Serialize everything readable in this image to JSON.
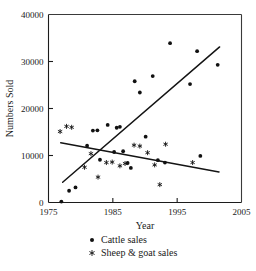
{
  "chart_data": {
    "type": "scatter",
    "title": "",
    "xlabel": "Year",
    "ylabel": "Numbers Sold",
    "xlim": [
      1975,
      2005
    ],
    "ylim": [
      0,
      40000
    ],
    "xticks": [
      1975,
      1985,
      1995,
      2005
    ],
    "yticks": [
      0,
      10000,
      20000,
      30000,
      40000
    ],
    "xtick_labels": [
      "1975",
      "1985",
      "1995",
      "2005"
    ],
    "ytick_labels": [
      "0",
      "10000",
      "20000",
      "30000",
      "40000"
    ],
    "grid": false,
    "legend_position": "below-axes",
    "series": [
      {
        "name": "Cattle sales",
        "marker": "filled-circle",
        "color": "#111111",
        "points": [
          [
            1977.0,
            200
          ],
          [
            1978.2,
            2500
          ],
          [
            1979.2,
            3200
          ],
          [
            1981.0,
            12100
          ],
          [
            1981.9,
            15300
          ],
          [
            1982.6,
            15350
          ],
          [
            1983.0,
            9100
          ],
          [
            1984.2,
            16500
          ],
          [
            1985.2,
            10750
          ],
          [
            1985.6,
            15900
          ],
          [
            1986.1,
            16100
          ],
          [
            1986.6,
            10900
          ],
          [
            1987.3,
            8400
          ],
          [
            1987.8,
            7350
          ],
          [
            1988.4,
            25800
          ],
          [
            1989.2,
            23400
          ],
          [
            1990.1,
            14000
          ],
          [
            1991.2,
            26900
          ],
          [
            1992.0,
            9000
          ],
          [
            1993.1,
            8500
          ],
          [
            1993.9,
            33900
          ],
          [
            1997.0,
            25200
          ],
          [
            1998.1,
            32200
          ],
          [
            1998.6,
            9900
          ],
          [
            2001.3,
            29300
          ]
        ]
      },
      {
        "name": "Sheep & goat sales",
        "marker": "asterisk",
        "color": "#111111",
        "points": [
          [
            1976.8,
            15100
          ],
          [
            1977.8,
            16200
          ],
          [
            1978.6,
            16000
          ],
          [
            1980.6,
            7500
          ],
          [
            1981.6,
            10400
          ],
          [
            1982.7,
            5400
          ],
          [
            1984.0,
            8500
          ],
          [
            1984.9,
            8600
          ],
          [
            1986.1,
            7800
          ],
          [
            1986.9,
            8300
          ],
          [
            1988.3,
            12200
          ],
          [
            1989.2,
            12000
          ],
          [
            1990.4,
            10600
          ],
          [
            1991.5,
            8000
          ],
          [
            1992.3,
            3800
          ],
          [
            1993.2,
            12400
          ],
          [
            1997.4,
            8500
          ]
        ]
      }
    ],
    "trend_lines": [
      {
        "name": "cattle-trend",
        "from": [
          1977.2,
          4300
        ],
        "to": [
          2001.6,
          33100
        ]
      },
      {
        "name": "sheep-goat-trend",
        "from": [
          1976.9,
          12700
        ],
        "to": [
          2001.5,
          6500
        ]
      }
    ]
  },
  "legend": {
    "items": [
      {
        "label": "Cattle sales",
        "marker": "filled-circle"
      },
      {
        "label": "Sheep & goat sales",
        "marker": "asterisk"
      }
    ]
  }
}
